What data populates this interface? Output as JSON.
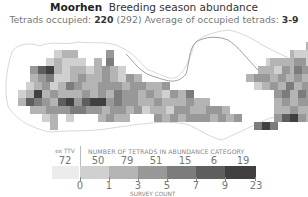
{
  "header": {
    "species": "Moorhen",
    "subtitle_title": "Breeding season abundance",
    "tetrads_label": "Tetrads occupied:",
    "tetrads_value": "220",
    "tetrads_total": "(292)",
    "average_label": "Average of occupied tetrads:",
    "average_value": "3-9"
  },
  "legend": {
    "extv_label": "ex TTV",
    "extv_count": "72",
    "category_heading": "NUMBER OF TETRADS IN ABUNDANCE CATEGORY",
    "counts": [
      "50",
      "79",
      "51",
      "15",
      "6",
      "19"
    ],
    "ticks": [
      "0",
      "1",
      "3",
      "5",
      "7",
      "9",
      "23"
    ],
    "axis_label": "SURVEY COUNT",
    "colors": [
      "#ececec",
      "#d0d0d0",
      "#b4b4b4",
      "#989898",
      "#7c7c7c",
      "#5e5e5e",
      "#404040"
    ]
  },
  "chart_data": {
    "type": "heatmap",
    "subtitle": "Tetrads occupied: 220 (292) Average of occupied tetrads: 3-9",
    "legend_title": "NUMBER OF TETRADS IN ABUNDANCE CATEGORY",
    "xlabel": "SURVEY COUNT",
    "categories": [
      "ex TTV",
      "0-1",
      "1-3",
      "3-5",
      "5-7",
      "7-9",
      "9-23"
    ],
    "bin_edges": [
      0,
      1,
      3,
      5,
      7,
      9,
      23
    ],
    "values": [
      72,
      50,
      79,
      51,
      15,
      6,
      19
    ],
    "tetrads_occupied": 220,
    "tetrads_total": 292,
    "average_occupied": "3-9"
  },
  "map": {
    "cell_size": 8,
    "origin_x": 6,
    "origin_y": 34,
    "rows": [
      "...................................................................................6........",
      "...........................................................................2.1...13.........",
      "............1.2.2........3.............................................211.1.33..6554.......",
      "..........1.2.1.1.1...2..4.......................................12.2.2.33.12.3.56.6.......",
      "......3.5.6.2.1.2.2.1.2.3.2.1..................................2.2.1.3.24.3.3.12.4.2.65....",
      "......2.3.4.1.1.2.3.2.2.3.2.1.3.2...........................2.3.3.2.3.2.3.2.2.3.1.3.2.3....",
      ".....1.2.3.1.2.4.3.2.2.3.3.3.2.3.3.2.2.3......................1.2.3.2.4.2.3.3.1.2.1.2.5....",
      "...1.2.6.2.3.2.2.2.3.2.3.2.4.3.3.2.3.2.1.3.2.4.....................3.4.2.4.3.2.2.3.3.1.1...",
      "...2.5.4.3.2.5.6.3.5.6.6.3.4.3.3.2.2.3.2.2.2.3.2.2.................2.3.2.3.3.3.5.2.3.2.....",
      "......2.2.3.3.3.4.4.3.3.2.3.3.2.3.1.2.2.1.3.3.2.2.3.3.2............2.2.3.2.2.5.3.2.......",
      ".........1.2...1.......2.3.2.2.......3.2.3.2.3.3.3.2.3.2.3.........3.5.6.3.2..........",
      "...........2..................................................4.6.4......................",
      "............................................................................................"
    ]
  }
}
